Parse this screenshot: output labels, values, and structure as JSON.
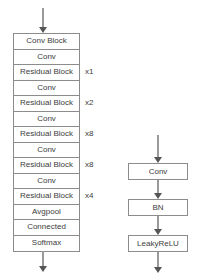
{
  "diagram": {
    "backbone": {
      "name": "backbone-stack",
      "rows": [
        {
          "label": "Conv Block",
          "repeat": ""
        },
        {
          "label": "Conv",
          "repeat": ""
        },
        {
          "label": "Residual Block",
          "repeat": "x1"
        },
        {
          "label": "Conv",
          "repeat": ""
        },
        {
          "label": "Residual Block",
          "repeat": "x2"
        },
        {
          "label": "Conv",
          "repeat": ""
        },
        {
          "label": "Residual Block",
          "repeat": "x8"
        },
        {
          "label": "Conv",
          "repeat": ""
        },
        {
          "label": "Residual Block",
          "repeat": "x8"
        },
        {
          "label": "Conv",
          "repeat": ""
        },
        {
          "label": "Residual Block",
          "repeat": "x4"
        },
        {
          "label": "Avgpool",
          "repeat": ""
        },
        {
          "label": "Connected",
          "repeat": ""
        },
        {
          "label": "Softmax",
          "repeat": ""
        }
      ]
    },
    "conv_block_detail": {
      "name": "conv-block-detail",
      "boxes": [
        {
          "label": "Conv"
        },
        {
          "label": "BN"
        },
        {
          "label": "LeakyReLU"
        }
      ]
    },
    "colors": {
      "box_border": "#8c8c8c",
      "arrow_shaft": "#9a9a9a",
      "arrow_head": "#555555",
      "text": "#3d3d3d",
      "background": "#ffffff"
    }
  }
}
